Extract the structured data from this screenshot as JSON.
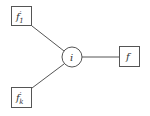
{
  "diagram": {
    "nodes": [
      {
        "id": "f1",
        "shape": "box",
        "label": "f",
        "prime": "′",
        "subscript": "1",
        "x": 11,
        "y": 6,
        "w": 21,
        "h": 20
      },
      {
        "id": "fk",
        "shape": "box",
        "label": "f",
        "prime": "′",
        "subscript": "k",
        "x": 11,
        "y": 87,
        "w": 21,
        "h": 21
      },
      {
        "id": "i",
        "shape": "circle",
        "label": "i",
        "cx": 72,
        "cy": 57,
        "r": 10
      },
      {
        "id": "f",
        "shape": "box",
        "label": "f",
        "x": 119,
        "y": 46,
        "w": 21,
        "h": 21
      }
    ],
    "edges": [
      {
        "from": "f1",
        "to": "i"
      },
      {
        "from": "fk",
        "to": "i"
      },
      {
        "from": "i",
        "to": "f"
      }
    ],
    "colors": {
      "stroke": "#555555",
      "text": "#333333",
      "background": "#ffffff"
    }
  }
}
